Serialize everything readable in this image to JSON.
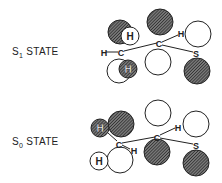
{
  "diagram": {
    "states": [
      {
        "id": "s1",
        "label_main": "S",
        "label_sub": "1",
        "label_suffix": " STATE",
        "atoms": {
          "left_c": "C",
          "left_h": "H",
          "h_up": "H",
          "h_down": "H",
          "mid_c": "C",
          "mid_h": "H",
          "s": "S"
        }
      },
      {
        "id": "s0",
        "label_main": "S",
        "label_sub": "0",
        "label_suffix": " STATE",
        "atoms": {
          "left_c": "C",
          "left_h_right": "H",
          "h_up": "H",
          "h_down": "H",
          "mid_c": "C",
          "mid_h": "H",
          "s": "S"
        }
      }
    ],
    "colors": {
      "ink": "#222222",
      "hatch": "#555555",
      "background": "#ffffff"
    }
  }
}
